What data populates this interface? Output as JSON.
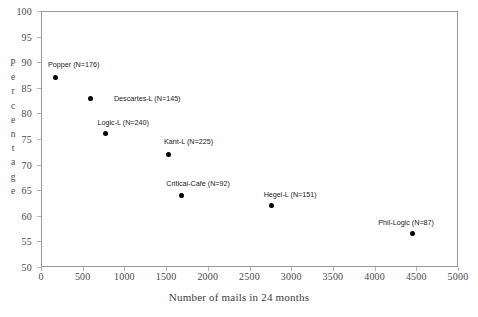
{
  "chart_data": {
    "type": "scatter",
    "title": "",
    "xlabel": "Number of mails in 24 months",
    "ylabel": "Percentage",
    "ylabel_letters": [
      "P",
      "e",
      "r",
      "c",
      "e",
      "n",
      "t",
      "a",
      "g",
      "e"
    ],
    "xlim": [
      0,
      5000
    ],
    "ylim": [
      50,
      100
    ],
    "xticks": [
      0,
      500,
      1000,
      1500,
      2000,
      2500,
      3000,
      3500,
      4000,
      4500,
      5000
    ],
    "yticks": [
      50,
      55,
      60,
      65,
      70,
      75,
      80,
      85,
      90,
      95,
      100
    ],
    "grid": false,
    "legend": "none",
    "marker_color": "#000000",
    "axis_color": "#9a9a9a",
    "points": [
      {
        "label": "Popper (N=176)",
        "x": 176,
        "y": 87,
        "label_dx": 18,
        "label_dy": -14
      },
      {
        "label": "Descartes-L (N=145)",
        "x": 590,
        "y": 83,
        "label_dx": 57,
        "label_dy": 0
      },
      {
        "label": "Logic-L (N=240)",
        "x": 770,
        "y": 76,
        "label_dx": 18,
        "label_dy": -12
      },
      {
        "label": "Kant-L (N=225)",
        "x": 1530,
        "y": 72,
        "label_dx": 20,
        "label_dy": -13
      },
      {
        "label": "Critical-Cafe (N=92)",
        "x": 1680,
        "y": 64,
        "label_dx": 17,
        "label_dy": -12
      },
      {
        "label": "Hegel-L (N=151)",
        "x": 2760,
        "y": 62,
        "label_dx": 19,
        "label_dy": -12
      },
      {
        "label": "Phil-Logic (N=87)",
        "x": 4450,
        "y": 56.5,
        "label_dx": -6,
        "label_dy": -12
      }
    ]
  }
}
